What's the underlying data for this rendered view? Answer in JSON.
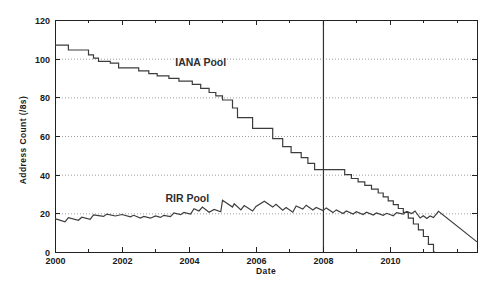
{
  "chart_data": {
    "type": "line",
    "xlabel": "Date",
    "ylabel": "Address Count (/8s)",
    "xlim": [
      2000,
      2012.6
    ],
    "ylim": [
      0,
      120
    ],
    "grid": "horizontal-dotted",
    "legend_position": "inline-labels",
    "background": "#ffffff",
    "axis_color": "#222222",
    "grid_color": "#9e9e9e",
    "xticks": [
      {
        "v": 2000,
        "label": "2000"
      },
      {
        "v": 2001
      },
      {
        "v": 2002,
        "label": "2002"
      },
      {
        "v": 2003
      },
      {
        "v": 2004,
        "label": "2004"
      },
      {
        "v": 2005
      },
      {
        "v": 2006,
        "label": "2006"
      },
      {
        "v": 2007
      },
      {
        "v": 2008,
        "label": "2008"
      },
      {
        "v": 2009
      },
      {
        "v": 2010,
        "label": "2010"
      },
      {
        "v": 2011
      },
      {
        "v": 2012
      }
    ],
    "yticks": [
      {
        "v": 0,
        "label": "0"
      },
      {
        "v": 20,
        "label": "20"
      },
      {
        "v": 40,
        "label": "40"
      },
      {
        "v": 60,
        "label": "60"
      },
      {
        "v": 80,
        "label": "80"
      },
      {
        "v": 100,
        "label": "100"
      },
      {
        "v": 120,
        "label": "120"
      }
    ],
    "vline": {
      "x": 2008,
      "color": "#333333"
    },
    "series": [
      {
        "name": "IANA Pool",
        "style": "steps",
        "color": "#3c3c3c",
        "label_at": [
          2004.35,
          97.8
        ],
        "points": [
          [
            2000.0,
            107
          ],
          [
            2000.4,
            104.5
          ],
          [
            2001.0,
            102
          ],
          [
            2001.15,
            100.3
          ],
          [
            2001.3,
            98.6
          ],
          [
            2001.65,
            97.7
          ],
          [
            2001.9,
            95.2
          ],
          [
            2002.5,
            93.7
          ],
          [
            2002.8,
            92.3
          ],
          [
            2003.05,
            91.1
          ],
          [
            2003.4,
            89.8
          ],
          [
            2003.7,
            88.4
          ],
          [
            2004.1,
            86.7
          ],
          [
            2004.35,
            84.6
          ],
          [
            2004.6,
            82.5
          ],
          [
            2004.8,
            80.8
          ],
          [
            2005.0,
            78.6
          ],
          [
            2005.3,
            74.5
          ],
          [
            2005.45,
            69.5
          ],
          [
            2005.9,
            64
          ],
          [
            2006.5,
            58.6
          ],
          [
            2006.8,
            54.5
          ],
          [
            2007.05,
            51.4
          ],
          [
            2007.35,
            48.8
          ],
          [
            2007.55,
            45.9
          ],
          [
            2007.75,
            42.6
          ],
          [
            2008.65,
            40
          ],
          [
            2008.85,
            38
          ],
          [
            2009.05,
            36.3
          ],
          [
            2009.25,
            34.5
          ],
          [
            2009.45,
            32.5
          ],
          [
            2009.65,
            30.5
          ],
          [
            2009.8,
            28.5
          ],
          [
            2009.95,
            26.5
          ],
          [
            2010.1,
            24.5
          ],
          [
            2010.25,
            22.5
          ],
          [
            2010.4,
            20.5
          ],
          [
            2010.55,
            17.5
          ],
          [
            2010.7,
            14.5
          ],
          [
            2010.85,
            11.5
          ],
          [
            2011.0,
            8
          ],
          [
            2011.15,
            4
          ],
          [
            2011.3,
            0
          ],
          [
            2011.35,
            0
          ]
        ]
      },
      {
        "name": "RIR Pool",
        "style": "linear",
        "color": "#3c3c3c",
        "label_at": [
          2003.95,
          27.9
        ],
        "points": [
          [
            2000.0,
            17.3
          ],
          [
            2000.3,
            15.6
          ],
          [
            2000.4,
            17.8
          ],
          [
            2000.7,
            16.4
          ],
          [
            2000.8,
            18.0
          ],
          [
            2001.05,
            16.9
          ],
          [
            2001.15,
            19.2
          ],
          [
            2001.45,
            18.4
          ],
          [
            2001.55,
            19.6
          ],
          [
            2001.8,
            18.6
          ],
          [
            2002.0,
            19.4
          ],
          [
            2002.25,
            18.2
          ],
          [
            2002.35,
            19.0
          ],
          [
            2002.55,
            17.6
          ],
          [
            2002.65,
            18.4
          ],
          [
            2002.85,
            17.5
          ],
          [
            2003.0,
            18.6
          ],
          [
            2003.15,
            17.9
          ],
          [
            2003.25,
            19.0
          ],
          [
            2003.45,
            18.3
          ],
          [
            2003.55,
            20.2
          ],
          [
            2003.75,
            19.3
          ],
          [
            2003.85,
            20.5
          ],
          [
            2004.05,
            19.6
          ],
          [
            2004.15,
            22.4
          ],
          [
            2004.3,
            21.2
          ],
          [
            2004.4,
            23.3
          ],
          [
            2004.6,
            20.6
          ],
          [
            2004.75,
            22.0
          ],
          [
            2004.95,
            20.8
          ],
          [
            2005.0,
            26.8
          ],
          [
            2005.3,
            23.2
          ],
          [
            2005.35,
            25.0
          ],
          [
            2005.55,
            21.8
          ],
          [
            2005.65,
            24.0
          ],
          [
            2005.9,
            21.2
          ],
          [
            2006.0,
            23.6
          ],
          [
            2006.25,
            26.2
          ],
          [
            2006.5,
            23.2
          ],
          [
            2006.6,
            24.6
          ],
          [
            2006.8,
            21.6
          ],
          [
            2006.9,
            23.0
          ],
          [
            2007.1,
            20.6
          ],
          [
            2007.2,
            23.8
          ],
          [
            2007.4,
            22.2
          ],
          [
            2007.5,
            24.2
          ],
          [
            2007.7,
            21.8
          ],
          [
            2007.8,
            23.0
          ],
          [
            2008.0,
            21.4
          ],
          [
            2008.1,
            22.8
          ],
          [
            2008.3,
            20.4
          ],
          [
            2008.4,
            21.8
          ],
          [
            2008.6,
            19.9
          ],
          [
            2008.7,
            21.2
          ],
          [
            2008.9,
            19.6
          ],
          [
            2009.0,
            20.8
          ],
          [
            2009.2,
            19.4
          ],
          [
            2009.3,
            20.6
          ],
          [
            2009.5,
            19.1
          ],
          [
            2009.6,
            20.2
          ],
          [
            2009.8,
            19.0
          ],
          [
            2009.9,
            20.0
          ],
          [
            2010.1,
            18.8
          ],
          [
            2010.2,
            20.4
          ],
          [
            2010.4,
            19.6
          ],
          [
            2010.5,
            21.0
          ],
          [
            2010.65,
            19.9
          ],
          [
            2010.75,
            21.2
          ],
          [
            2010.9,
            17.6
          ],
          [
            2011.0,
            18.8
          ],
          [
            2011.1,
            17.4
          ],
          [
            2011.2,
            18.6
          ],
          [
            2011.3,
            17.8
          ],
          [
            2011.45,
            21.0
          ],
          [
            2012.6,
            5.2
          ]
        ]
      }
    ]
  }
}
